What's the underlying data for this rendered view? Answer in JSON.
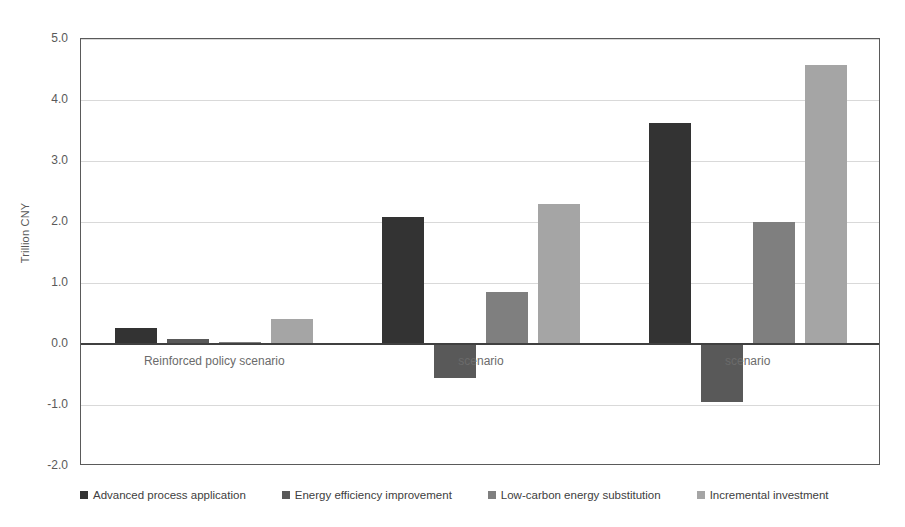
{
  "chart_data": {
    "type": "bar",
    "title": "",
    "subtitle": "",
    "xlabel": "",
    "ylabel": "Trillion CNY",
    "ylim": [
      -2.0,
      5.0
    ],
    "y_ticks": [
      "5.0",
      "4.0",
      "3.0",
      "2.0",
      "1.0",
      "0.0",
      "-1.0",
      "-2.0"
    ],
    "y_tick_values": [
      5.0,
      4.0,
      3.0,
      2.0,
      1.0,
      0.0,
      -1.0,
      -2.0
    ],
    "grid": true,
    "legend_position": "bottom",
    "categories": [
      "Reinforced policy scenario",
      "scenario",
      "scenario"
    ],
    "series": [
      {
        "name": "Advanced process application",
        "color": "#333333",
        "values": [
          0.27,
          2.08,
          3.63
        ]
      },
      {
        "name": "Energy efficiency improvement",
        "color": "#595959",
        "values": [
          0.09,
          -0.55,
          -0.95
        ]
      },
      {
        "name": "Low-carbon energy substitution",
        "color": "#7f7f7f",
        "values": [
          0.03,
          0.86,
          2.0
        ]
      },
      {
        "name": "Incremental investment",
        "color": "#a5a5a5",
        "values": [
          0.41,
          2.3,
          4.57
        ]
      }
    ]
  },
  "axis": {
    "y_title": "Trillion CNY"
  },
  "colors": {
    "plot_border": "#5a5a5a",
    "gridline": "#d9d9d9",
    "zero_line": "#404040",
    "tick_text": "#595959",
    "category_text": "#6b6b6b",
    "legend_text": "#404040",
    "background": "#ffffff"
  }
}
